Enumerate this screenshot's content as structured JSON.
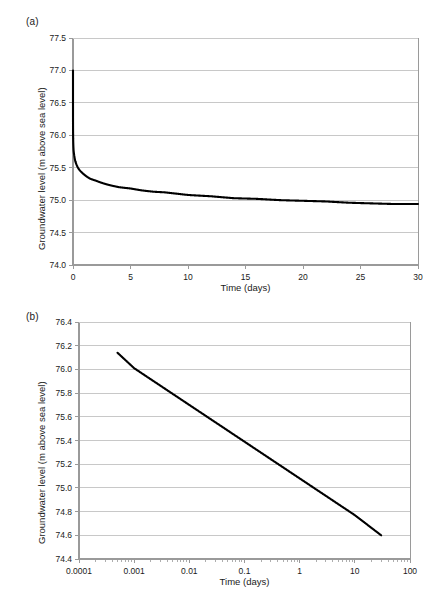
{
  "figure": {
    "panels": [
      {
        "tag": "(a)",
        "xlabel": "Time (days)",
        "ylabel": "Groundwater level (m above sea level)"
      },
      {
        "tag": "(b)",
        "xlabel": "Time (days)",
        "ylabel": "Groundwater level (m above sea level)"
      }
    ]
  },
  "chart_data": [
    {
      "type": "line",
      "title": "",
      "panel": "(a)",
      "xlabel": "Time (days)",
      "ylabel": "Groundwater level (m above sea level)",
      "xscale": "linear",
      "yscale": "linear",
      "xlim": [
        0,
        30
      ],
      "ylim": [
        74.0,
        77.5
      ],
      "xticks": [
        0,
        5,
        10,
        15,
        20,
        25,
        30
      ],
      "xtick_labels": [
        "0",
        "5",
        "10",
        "15",
        "20",
        "25",
        "30"
      ],
      "yticks": [
        74.0,
        74.5,
        75.0,
        75.5,
        76.0,
        76.5,
        77.0,
        77.5
      ],
      "ytick_labels": [
        "74.0",
        "74.5",
        "75.0",
        "75.5",
        "76.0",
        "76.5",
        "77.0",
        "77.5"
      ],
      "grid": "horizontal",
      "legend": "none",
      "line_color": "#000000",
      "grid_color": "#c8c8c8",
      "series": [
        {
          "name": "Groundwater level",
          "x": [
            0,
            0.0005,
            0.001,
            0.002,
            0.005,
            0.01,
            0.02,
            0.05,
            0.1,
            0.2,
            0.3,
            0.5,
            0.75,
            1,
            1.5,
            2,
            3,
            4,
            5,
            6,
            7,
            8,
            9,
            10,
            12,
            14,
            16,
            18,
            20,
            22,
            24,
            26,
            28,
            30
          ],
          "y": [
            77.0,
            76.41,
            76.31,
            76.22,
            76.09,
            75.99,
            75.9,
            75.77,
            75.7,
            75.6,
            75.55,
            75.48,
            75.43,
            75.39,
            75.33,
            75.3,
            75.24,
            75.2,
            75.18,
            75.15,
            75.13,
            75.12,
            75.1,
            75.08,
            75.06,
            75.03,
            75.02,
            75.0,
            74.99,
            74.98,
            74.96,
            74.95,
            74.94,
            74.94
          ]
        }
      ],
      "notes": "Steep initial drawdown from 77.0 m at t=0, flattening to about 74.6 m at t=30 days."
    },
    {
      "type": "line",
      "title": "",
      "panel": "(b)",
      "xlabel": "Time (days)",
      "ylabel": "Groundwater level (m above sea level)",
      "xscale": "log",
      "yscale": "linear",
      "xlim": [
        0.0001,
        100
      ],
      "ylim": [
        74.4,
        76.4
      ],
      "xticks": [
        0.0001,
        0.001,
        0.01,
        0.1,
        1,
        10,
        100
      ],
      "xtick_labels": [
        "0.0001",
        "0.001",
        "0.01",
        "0.1",
        "1",
        "10",
        "100"
      ],
      "yticks": [
        74.4,
        74.6,
        74.8,
        75.0,
        75.2,
        75.4,
        75.6,
        75.8,
        76.0,
        76.2,
        76.4
      ],
      "ytick_labels": [
        "74.4",
        "74.6",
        "74.8",
        "75.0",
        "75.2",
        "75.4",
        "75.6",
        "75.8",
        "76.0",
        "76.2",
        "76.4"
      ],
      "grid": "horizontal",
      "legend": "none",
      "line_color": "#000000",
      "grid_color": "#c8c8c8",
      "series": [
        {
          "name": "Groundwater level",
          "x": [
            0.0005,
            0.001,
            0.01,
            0.1,
            1,
            10,
            30
          ],
          "y": [
            76.14,
            76.01,
            75.7,
            75.39,
            75.08,
            74.77,
            74.6
          ]
        }
      ],
      "notes": "Straight line on semi-log axes: level decreases about 0.307 m per log cycle of time, from 76.14 m at t=0.0005 d to 74.60 m at t=30 d."
    }
  ]
}
